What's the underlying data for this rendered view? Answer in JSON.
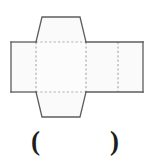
{
  "figure": {
    "type": "geometric-net",
    "canvas": {
      "width": 148,
      "height": 162
    },
    "colors": {
      "solid_stroke": "#5d5d5d",
      "dashed_stroke": "#b0b0b0",
      "face_fill": "#fafafa",
      "center_fill": "#fcfcfc",
      "text": "#1d1d1d",
      "background": "#ffffff"
    },
    "strokes": {
      "solid_width": 1.3,
      "dashed_width": 1.2,
      "dash_pattern": "2.2 2.2"
    },
    "shapes": {
      "band": {
        "name": "horizontal-band",
        "points": "11,42 143,42 143,92 11,92",
        "x_left": 11,
        "x_right": 143,
        "y_top": 42,
        "y_bottom": 92
      },
      "top_flap": {
        "name": "top-trapezoid-flap",
        "points": "36,42 42,17 80,17 86,42"
      },
      "bottom_flap": {
        "name": "bottom-trapezoid-flap",
        "points": "36,92 42,117 80,117 86,92"
      },
      "center_panel": {
        "name": "center-panel",
        "x_left": 36,
        "x_right": 86,
        "y_top": 42,
        "y_bottom": 92
      }
    },
    "fold_lines": [
      {
        "name": "fold-left",
        "x1": 36,
        "y1": 42,
        "x2": 36,
        "y2": 92
      },
      {
        "name": "fold-right",
        "x1": 86,
        "y1": 42,
        "x2": 86,
        "y2": 92
      },
      {
        "name": "fold-far-right",
        "x1": 118,
        "y1": 42,
        "x2": 118,
        "y2": 92
      },
      {
        "name": "fold-top",
        "x1": 36,
        "y1": 42,
        "x2": 86,
        "y2": 42
      },
      {
        "name": "fold-bottom",
        "x1": 36,
        "y1": 92,
        "x2": 86,
        "y2": 92
      }
    ]
  },
  "answer": {
    "open_paren": "(",
    "close_paren": ")",
    "value": ""
  }
}
